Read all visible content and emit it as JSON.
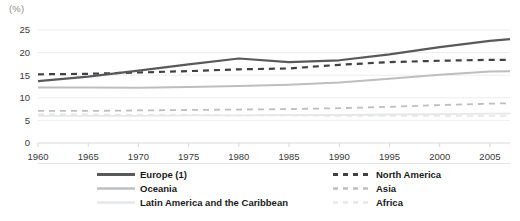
{
  "axis_unit_label": "(%)",
  "legend": {
    "left_column": [
      {
        "label": "Europe (1)",
        "key": "europe",
        "style": "solid",
        "color": "#58595b",
        "width": 2.2
      },
      {
        "label": "Oceania",
        "key": "oceania",
        "style": "solid",
        "color": "#bcbec0",
        "width": 2.0
      },
      {
        "label": "Latin America and the Caribbean",
        "key": "latin_america",
        "style": "solid",
        "color": "#e6e7e8",
        "width": 1.8
      }
    ],
    "right_column": [
      {
        "label": "North America",
        "key": "north_america",
        "style": "dashed",
        "color": "#414042",
        "width": 2.2
      },
      {
        "label": "Asia",
        "key": "asia",
        "style": "dashed",
        "color": "#bcbec0",
        "width": 1.8
      },
      {
        "label": "Africa",
        "key": "africa",
        "style": "dashed",
        "color": "#e6e7e8",
        "width": 1.8
      }
    ]
  },
  "chart_data": {
    "type": "line",
    "title": "",
    "subtitle": "",
    "xlabel": "",
    "ylabel": "(%)",
    "xlim": [
      1960,
      2007
    ],
    "ylim": [
      0,
      25
    ],
    "yticks": [
      0,
      5,
      10,
      15,
      20,
      25
    ],
    "xticks": [
      1960,
      1965,
      1970,
      1975,
      1980,
      1985,
      1990,
      1995,
      2000,
      2005
    ],
    "grid": "horizontal",
    "legend_position": "bottom",
    "x": [
      1960,
      1965,
      1970,
      1975,
      1980,
      1985,
      1990,
      1995,
      2000,
      2005,
      2007
    ],
    "series": [
      {
        "name": "Europe (1)",
        "key": "europe",
        "style": "solid",
        "color": "#58595b",
        "width": 2.2,
        "values": [
          13.7,
          14.7,
          16.0,
          17.4,
          18.7,
          17.9,
          18.3,
          19.6,
          21.2,
          22.6,
          23.0
        ]
      },
      {
        "name": "North America",
        "key": "north_america",
        "style": "dashed",
        "color": "#414042",
        "width": 2.2,
        "values": [
          15.2,
          15.3,
          15.6,
          15.9,
          16.3,
          16.5,
          17.3,
          17.9,
          18.2,
          18.4,
          18.4
        ]
      },
      {
        "name": "Oceania",
        "key": "oceania",
        "style": "solid",
        "color": "#bcbec0",
        "width": 2.0,
        "values": [
          12.3,
          12.3,
          12.2,
          12.4,
          12.6,
          12.9,
          13.4,
          14.2,
          15.1,
          15.8,
          15.9
        ]
      },
      {
        "name": "Asia",
        "key": "asia",
        "style": "dashed",
        "color": "#bcbec0",
        "width": 1.8,
        "values": [
          7.1,
          7.1,
          7.2,
          7.3,
          7.4,
          7.5,
          7.7,
          8.0,
          8.4,
          8.7,
          8.8
        ]
      },
      {
        "name": "Latin America and the Caribbean",
        "key": "latin_america",
        "style": "solid",
        "color": "#e6e7e8",
        "width": 1.8,
        "values": [
          6.0,
          6.0,
          6.0,
          6.1,
          6.1,
          6.2,
          6.2,
          6.3,
          6.4,
          6.5,
          6.5
        ]
      },
      {
        "name": "Africa",
        "key": "africa",
        "style": "dashed",
        "color": "#e6e7e8",
        "width": 1.8,
        "values": [
          6.3,
          6.3,
          6.2,
          6.2,
          6.1,
          6.1,
          6.0,
          6.0,
          6.0,
          6.0,
          6.0
        ]
      }
    ]
  }
}
